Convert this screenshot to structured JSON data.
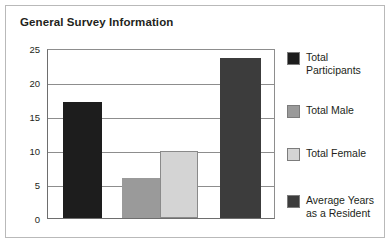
{
  "card": {
    "title": "General Survey Information",
    "border_color": "#b9b9b9"
  },
  "chart_data": {
    "type": "bar",
    "title": "General Survey Information",
    "xlabel": "",
    "ylabel": "",
    "ylim": [
      0,
      25
    ],
    "yticks": [
      "0",
      "5",
      "10",
      "15",
      "20",
      "25"
    ],
    "grid": true,
    "legend_position": "right",
    "categories": [
      "Total Participants",
      "Total Male",
      "Total Female",
      "Average Years as a Resident"
    ],
    "values": [
      17,
      5.9,
      9.9,
      23.5
    ],
    "colors": [
      "#1d1d1d",
      "#9a9a9a",
      "#d4d4d4",
      "#3c3c3c"
    ],
    "series": [
      {
        "name": "Total Participants",
        "label": "Total\nParticipants",
        "value": 17,
        "color": "#1d1d1d"
      },
      {
        "name": "Total Male",
        "label": "Total Male",
        "value": 5.9,
        "color": "#9a9a9a"
      },
      {
        "name": "Total Female",
        "label": "Total Female",
        "value": 9.9,
        "color": "#d4d4d4"
      },
      {
        "name": "Average Years as a Resident",
        "label": "Average Years\nas a Resident",
        "value": 23.5,
        "color": "#3c3c3c"
      }
    ]
  },
  "axis": {
    "gridline_color": "#8d8d8d",
    "axis_color": "#6e6e6e"
  },
  "legend": {
    "items": [
      {
        "label": "Total\nParticipants",
        "color": "#1d1d1d"
      },
      {
        "label": "Total Male",
        "color": "#9a9a9a"
      },
      {
        "label": "Total Female",
        "color": "#d4d4d4"
      },
      {
        "label": "Average Years\nas a Resident",
        "color": "#3c3c3c"
      }
    ]
  }
}
